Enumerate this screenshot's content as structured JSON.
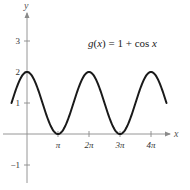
{
  "chart_data": {
    "type": "line",
    "title": "",
    "annotation": "g(x) = 1 + cos x",
    "annotation_parts": {
      "func": "g",
      "var": "x",
      "rhs": "1 + cos ",
      "rhs_var": "x"
    },
    "xlabel": "x",
    "ylabel": "y",
    "xlim": [
      -1.5708,
      14.1372
    ],
    "ylim": [
      -1,
      3
    ],
    "x_ticks": [
      {
        "value": 3.14159,
        "label": "π"
      },
      {
        "value": 6.28319,
        "label": "2π"
      },
      {
        "value": 9.42478,
        "label": "3π"
      },
      {
        "value": 12.56637,
        "label": "4π"
      }
    ],
    "y_ticks": [
      {
        "value": -1,
        "label": "−1"
      },
      {
        "value": 1,
        "label": "1"
      },
      {
        "value": 2,
        "label": "2"
      },
      {
        "value": 3,
        "label": "3"
      }
    ],
    "grid": false,
    "legend": null,
    "series": [
      {
        "name": "g(x) = 1 + cos x",
        "function": "1 + cos(x)",
        "x_range": [
          -1.5708,
          14.1372
        ],
        "key_points": [
          {
            "x": -1.5708,
            "y": 1
          },
          {
            "x": 0,
            "y": 2
          },
          {
            "x": 3.14159,
            "y": 0
          },
          {
            "x": 6.28319,
            "y": 2
          },
          {
            "x": 9.42478,
            "y": 0
          },
          {
            "x": 12.56637,
            "y": 2
          },
          {
            "x": 14.1372,
            "y": 1
          }
        ],
        "color": "#1a1a1a"
      }
    ]
  },
  "colors": {
    "axis": "#8a8a8a",
    "curve": "#1a1a1a"
  }
}
